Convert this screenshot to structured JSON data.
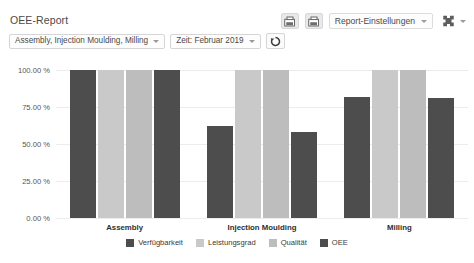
{
  "header": {
    "title": "OEE-Report",
    "filters": {
      "resources": "Assembly, Injection Moulding, Milling",
      "time": "Zeit: Februar 2019",
      "refresh_icon": "refresh-icon"
    },
    "toolbar": {
      "export_pdf_icon": "export-pdf-icon",
      "export_excel_icon": "export-excel-icon",
      "settings_label": "Report-Einstellungen",
      "expand_icon": "expand-icon"
    }
  },
  "chart_data": {
    "type": "bar",
    "title": "OEE-Report",
    "xlabel": "",
    "ylabel": "",
    "ylim": [
      0,
      100
    ],
    "grid": true,
    "legend_position": "bottom",
    "tick_labels": [
      "100.00 %",
      "75.00 %",
      "50.00 %",
      "25.00 %",
      "0.00 %"
    ],
    "ticks": [
      100,
      75,
      50,
      25,
      0
    ],
    "categories": [
      "Assembly",
      "Injection Moulding",
      "Milling"
    ],
    "series": [
      {
        "name": "Verfügbarkeit",
        "color": "#4d4d4d",
        "values": [
          100,
          62,
          82
        ]
      },
      {
        "name": "Leistungsgrad",
        "color": "#c9c9c9",
        "values": [
          100,
          100,
          100
        ]
      },
      {
        "name": "Qualität",
        "color": "#bdbdbd",
        "values": [
          100,
          100,
          100
        ]
      },
      {
        "name": "OEE",
        "color": "#4d4d4d",
        "values": [
          100,
          58,
          81
        ]
      }
    ]
  },
  "footer": {
    "cut_text": ""
  }
}
